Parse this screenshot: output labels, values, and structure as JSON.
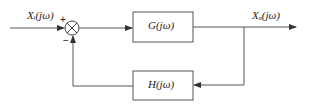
{
  "diagram": {
    "type": "feedback-control-block-diagram",
    "input_label": "Xᵢ(jω)",
    "output_label": "Xₒ(jω)",
    "forward_block": "G(jω)",
    "feedback_block": "H(jω)",
    "summing_plus": "+",
    "summing_minus": "−",
    "colors": {
      "line": "#444444",
      "text": "#222222",
      "background": "#ffffff"
    }
  }
}
